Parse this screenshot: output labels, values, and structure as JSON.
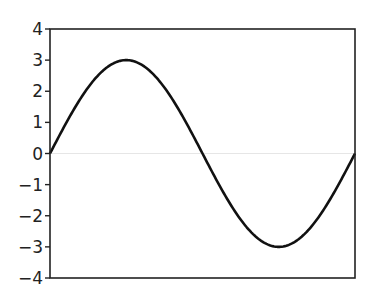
{
  "chart_data": {
    "type": "line",
    "title": "",
    "xlabel": "",
    "ylabel": "",
    "ylim": [
      -4,
      4
    ],
    "yticks": [
      4,
      3,
      2,
      1,
      0,
      -1,
      -2,
      -3,
      -4
    ],
    "ytick_labels": [
      "4",
      "3",
      "2",
      "1",
      "0",
      "−1",
      "−2",
      "−3",
      "−4"
    ],
    "xticks": [],
    "grid": false,
    "legend": null,
    "zero_line": true,
    "series": [
      {
        "name": "y = 3 sin(x)",
        "function": "3*sin(x)",
        "x_range": [
          0,
          6.2832
        ],
        "x": [
          0,
          0.7854,
          1.5708,
          2.3562,
          3.1416,
          3.927,
          4.7124,
          5.4978,
          6.2832
        ],
        "values": [
          0,
          2.12,
          3,
          2.12,
          0,
          -2.12,
          -3,
          -2.12,
          0
        ],
        "color": "#111111"
      }
    ]
  },
  "colors": {
    "axis": "#222222",
    "curve": "#111111",
    "zero_line": "#e6e6e6"
  }
}
